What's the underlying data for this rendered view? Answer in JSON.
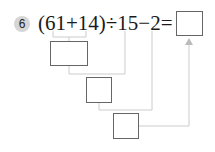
{
  "problem": {
    "number": "6",
    "expression": "(61+14)÷15−2="
  },
  "answer_boxes": [
    {
      "name": "step-1-box",
      "value": ""
    },
    {
      "name": "step-2-box",
      "value": ""
    },
    {
      "name": "step-3-box",
      "value": ""
    },
    {
      "name": "final-answer-box",
      "value": ""
    }
  ],
  "colors": {
    "badge": "#d6d6d6",
    "box_border": "#666666",
    "connector": "#cccccc",
    "arrow": "#bbbbbb"
  }
}
